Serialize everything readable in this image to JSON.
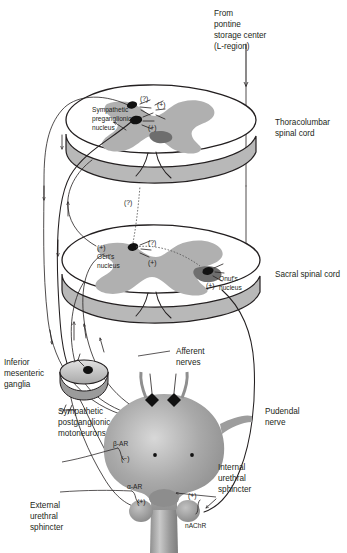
{
  "figure": {
    "background_color": "#ffffff",
    "line_color": "#231f20",
    "tissue_gray": "#b0b0b0"
  },
  "labels": {
    "pontine_source": "From\npontine\nstorage center\n(L-region)",
    "pontine_source_lines": [
      "From",
      "pontine",
      "storage center",
      "(L-region)"
    ],
    "thoracolumbar_cord": "Thoracolumbar\nspinal cord",
    "thoracolumbar_cord_lines": [
      "Thoracolumbar",
      "spinal cord"
    ],
    "sacral_cord": "Sacral spinal cord",
    "sympathetic_preganglionic_nucleus": "Sympathetic\npreganglionic\nnucleus",
    "sympathetic_preganglionic_nucleus_lines": [
      "Sympathetic",
      "preganglionic",
      "nucleus"
    ],
    "gerts_nucleus": "Gert's\nnucleus",
    "gerts_nucleus_lines": [
      "Gert's",
      "nucleus"
    ],
    "onufs_nucleus": "Onuf's\nnucleus",
    "onufs_nucleus_lines": [
      "Onuf's",
      "nucleus"
    ],
    "inferior_mesenteric_ganglia": "Inferior\nmesenteric\nganglia",
    "inferior_mesenteric_ganglia_lines": [
      "Inferior",
      "mesenteric",
      "ganglia"
    ],
    "sympathetic_postganglionic_motoneurons": "Sympathetic\npostganglionic\nmotoneurons",
    "sympathetic_postganglionic_motoneurons_lines": [
      "Sympathetic",
      "postganglionic",
      "motoneurons"
    ],
    "afferent_nerves": "Afferent\nnerves",
    "afferent_nerves_lines": [
      "Afferent",
      "nerves"
    ],
    "pudendal_nerve": "Pudendal\nnerve",
    "pudendal_nerve_lines": [
      "Pudendal",
      "nerve"
    ],
    "internal_urethral_sphincter": "Internal\nurethral\nsphincter",
    "internal_urethral_sphincter_lines": [
      "Internal",
      "urethral",
      "sphincter"
    ],
    "external_urethral_sphincter": "External\nurethral\nsphincter",
    "external_urethral_sphincter_lines": [
      "External",
      "urethral",
      "sphincter"
    ]
  },
  "receptors": {
    "beta_ar": "β-AR",
    "alpha_ar": "α-AR",
    "nachr": "nAChR"
  },
  "signs": {
    "plus": "(+)",
    "minus": "(−)",
    "unknown": "(?)"
  },
  "markers": [
    {
      "id": "tl-unknown",
      "sign": "(?)",
      "x": 144,
      "y": 98,
      "region": "thoracolumbar"
    },
    {
      "id": "tl-plus-upper",
      "sign": "(+)",
      "x": 161,
      "y": 104,
      "region": "thoracolumbar"
    },
    {
      "id": "tl-plus-lower",
      "sign": "(+)",
      "x": 152,
      "y": 124,
      "region": "thoracolumbar"
    },
    {
      "id": "interneuron-query",
      "sign": "(?)",
      "x": 131,
      "y": 201,
      "region": "interneuron"
    },
    {
      "id": "sac-gert-plus",
      "sign": "(+)",
      "x": 105,
      "y": 247,
      "region": "sacral"
    },
    {
      "id": "sac-unknown",
      "sign": "(?)",
      "x": 152,
      "y": 242,
      "region": "sacral"
    },
    {
      "id": "sac-plus-mid",
      "sign": "(+)",
      "x": 152,
      "y": 262,
      "region": "sacral"
    },
    {
      "id": "sac-onuf-plus",
      "sign": "(+)",
      "x": 212,
      "y": 284,
      "region": "sacral"
    },
    {
      "id": "bladder-beta-minus",
      "sign": "(−)",
      "x": 125,
      "y": 456,
      "region": "bladder-wall"
    },
    {
      "id": "urethra-alpha-plus",
      "sign": "(+)",
      "x": 144,
      "y": 500,
      "region": "internal-sphincter"
    },
    {
      "id": "urethra-nachr-plus",
      "sign": "(+)",
      "x": 196,
      "y": 492,
      "region": "external-sphincter"
    }
  ],
  "structures": [
    {
      "name": "thoracolumbar-spinal-cord",
      "type": "cord-cross-section"
    },
    {
      "name": "sacral-spinal-cord",
      "type": "cord-cross-section"
    },
    {
      "name": "inferior-mesenteric-ganglion",
      "type": "ganglion-disc"
    },
    {
      "name": "urinary-bladder",
      "type": "organ"
    },
    {
      "name": "urethra",
      "type": "organ"
    },
    {
      "name": "internal-urethral-sphincter",
      "type": "sphincter"
    },
    {
      "name": "external-urethral-sphincter",
      "type": "sphincter"
    },
    {
      "name": "bladder-wall-ganglia",
      "type": "ganglion-pair"
    }
  ]
}
